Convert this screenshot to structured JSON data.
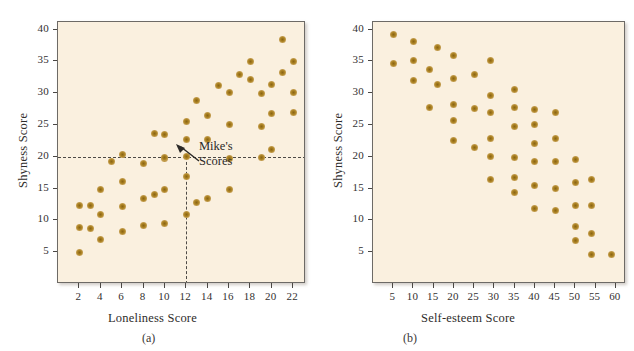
{
  "figure": {
    "background": "#ffffff",
    "panel_background": "#faf0df",
    "dot_color": "#a9801f",
    "frame_color": "#6d6a66"
  },
  "panels": [
    {
      "id": "panel-a",
      "caption": "(a)",
      "annotation": {
        "line1": "Mike's",
        "line2": "Scores",
        "point_x": 12,
        "point_y": 20
      },
      "chart_data": {
        "type": "scatter",
        "title": "",
        "xlabel": "Loneliness Score",
        "ylabel": "Shyness Score",
        "xlim": [
          0,
          23.2
        ],
        "ylim": [
          0,
          41.2
        ],
        "xticks": [
          2,
          4,
          6,
          8,
          10,
          12,
          14,
          16,
          18,
          20,
          22
        ],
        "yticks": [
          5,
          10,
          15,
          20,
          25,
          30,
          35,
          40
        ],
        "grid": false,
        "legend": "none",
        "reference_lines": [
          {
            "orientation": "horizontal",
            "value": 20,
            "style": "dashed"
          },
          {
            "orientation": "vertical",
            "value": 12,
            "style": "dashed"
          }
        ],
        "points": [
          [
            2,
            12.3
          ],
          [
            2,
            8.9
          ],
          [
            2,
            4.9
          ],
          [
            3,
            12.3
          ],
          [
            3,
            8.7
          ],
          [
            4,
            14.9
          ],
          [
            4,
            10.9
          ],
          [
            4,
            7.0
          ],
          [
            5,
            19.3
          ],
          [
            6,
            20.3
          ],
          [
            6,
            16.1
          ],
          [
            6,
            12.2
          ],
          [
            6,
            8.2
          ],
          [
            8,
            19.0
          ],
          [
            8,
            13.4
          ],
          [
            8,
            9.2
          ],
          [
            9,
            23.6
          ],
          [
            9,
            14.0
          ],
          [
            10,
            23.5
          ],
          [
            10,
            19.8
          ],
          [
            10,
            19.9
          ],
          [
            10,
            14.9
          ],
          [
            10,
            9.5
          ],
          [
            12,
            25.6
          ],
          [
            12,
            22.7
          ],
          [
            12,
            20.0
          ],
          [
            12,
            16.9
          ],
          [
            12,
            11.0
          ],
          [
            13,
            28.9
          ],
          [
            13,
            12.8
          ],
          [
            14,
            26.5
          ],
          [
            14,
            22.7
          ],
          [
            14,
            13.5
          ],
          [
            15,
            31.2
          ],
          [
            16,
            30.1
          ],
          [
            16,
            25.1
          ],
          [
            16,
            19.7
          ],
          [
            16,
            14.8
          ],
          [
            17,
            32.9
          ],
          [
            18,
            35.0
          ],
          [
            18,
            32.2
          ],
          [
            19,
            30.0
          ],
          [
            19,
            24.8
          ],
          [
            19,
            19.9
          ],
          [
            20,
            31.3
          ],
          [
            20,
            26.8
          ],
          [
            20,
            21.2
          ],
          [
            21,
            38.4
          ],
          [
            21,
            33.3
          ],
          [
            22,
            35.0
          ],
          [
            22,
            30.1
          ],
          [
            22,
            27.0
          ]
        ]
      }
    },
    {
      "id": "panel-b",
      "caption": "(b)",
      "chart_data": {
        "type": "scatter",
        "title": "",
        "xlabel": "Self-esteem Score",
        "ylabel": "Shyness Score",
        "xlim": [
          0,
          62.5
        ],
        "ylim": [
          0,
          41.2
        ],
        "xticks": [
          5,
          10,
          15,
          20,
          25,
          30,
          35,
          40,
          45,
          50,
          55,
          60
        ],
        "yticks": [
          5,
          10,
          15,
          20,
          25,
          30,
          35,
          40
        ],
        "grid": false,
        "legend": "none",
        "reference_lines": [],
        "points": [
          [
            5,
            39.3
          ],
          [
            5,
            34.6
          ],
          [
            10,
            38.1
          ],
          [
            10,
            35.2
          ],
          [
            10,
            32.0
          ],
          [
            14,
            33.8
          ],
          [
            14,
            27.8
          ],
          [
            16,
            37.2
          ],
          [
            16,
            31.4
          ],
          [
            20,
            35.9
          ],
          [
            20,
            32.3
          ],
          [
            20,
            28.3
          ],
          [
            20,
            25.7
          ],
          [
            20,
            22.5
          ],
          [
            25,
            33.0
          ],
          [
            25,
            27.6
          ],
          [
            25,
            21.5
          ],
          [
            29,
            35.1
          ],
          [
            29,
            29.7
          ],
          [
            29,
            26.9
          ],
          [
            29,
            22.9
          ],
          [
            29,
            20.1
          ],
          [
            29,
            16.4
          ],
          [
            35,
            30.6
          ],
          [
            35,
            27.7
          ],
          [
            35,
            24.7
          ],
          [
            35,
            19.9
          ],
          [
            35,
            16.8
          ],
          [
            35,
            14.4
          ],
          [
            40,
            27.5
          ],
          [
            40,
            25.1
          ],
          [
            40,
            22.1
          ],
          [
            40,
            19.2
          ],
          [
            40,
            15.5
          ],
          [
            40,
            11.8
          ],
          [
            45,
            26.9
          ],
          [
            45,
            22.9
          ],
          [
            45,
            19.2
          ],
          [
            45,
            15.0
          ],
          [
            45,
            11.5
          ],
          [
            50,
            19.6
          ],
          [
            50,
            15.9
          ],
          [
            50,
            12.4
          ],
          [
            50,
            9.1
          ],
          [
            50,
            6.9
          ],
          [
            54,
            16.5
          ],
          [
            54,
            12.3
          ],
          [
            54,
            8.0
          ],
          [
            54,
            4.7
          ],
          [
            59,
            4.6
          ]
        ]
      }
    }
  ]
}
